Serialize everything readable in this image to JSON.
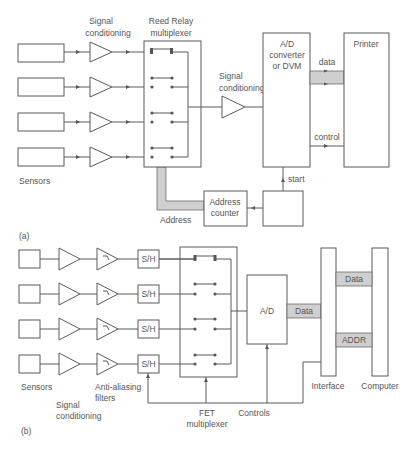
{
  "diagram_a": {
    "caption": "(a)",
    "labels": {
      "signal_conditioning_top_1": "Signal",
      "signal_conditioning_top_2": "conditioning",
      "reed_relay_1": "Reed Relay",
      "reed_relay_2": "multiplexer",
      "signal_conditioning_mid_1": "Signal",
      "signal_conditioning_mid_2": "conditioning",
      "ad_1": "A/D",
      "ad_2": "converter",
      "ad_3": "or DVM",
      "printer": "Printer",
      "data": "data",
      "control": "control",
      "start": "start",
      "sensors": "Sensors",
      "address": "Address",
      "address_counter_1": "Address",
      "address_counter_2": "counter"
    },
    "sensor_count": 4
  },
  "diagram_b": {
    "caption": "(b)",
    "labels": {
      "sh": "S/H",
      "ad": "A/D",
      "data_ad": "Data",
      "data_computer": "Data",
      "addr": "ADDR",
      "interface": "Interface",
      "computer": "Computer",
      "sensors": "Sensors",
      "anti_aliasing_1": "Anti-aliasing",
      "anti_aliasing_2": "filters",
      "signal_conditioning_1": "Signal",
      "signal_conditioning_2": "conditioning",
      "fet_1": "FET",
      "fet_2": "multiplexer",
      "controls": "Controls"
    },
    "channel_count": 4
  },
  "colors": {
    "line": "#5a5a5a",
    "bus_fill": "#cfcfcf",
    "text": "#555555",
    "background": "#ffffff"
  }
}
